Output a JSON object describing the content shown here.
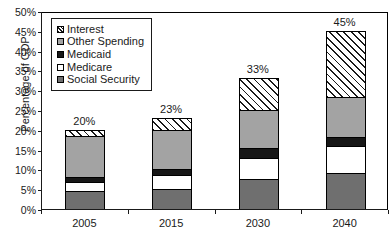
{
  "chart_data": {
    "type": "bar",
    "subtype": "stacked-column",
    "title": "",
    "xlabel": "",
    "ylabel": "Percentage of GDP",
    "categories": [
      "2005",
      "2015",
      "2030",
      "2040"
    ],
    "ylim": [
      0,
      50
    ],
    "ytick_labels": [
      "0%",
      "5%",
      "10%",
      "15%",
      "20%",
      "25%",
      "30%",
      "35%",
      "40%",
      "45%",
      "50%"
    ],
    "ytick_values": [
      0,
      5,
      10,
      15,
      20,
      25,
      30,
      35,
      40,
      45,
      50
    ],
    "yaxis_unit": "%",
    "grid": false,
    "legend_position": "upper-left-inside",
    "series": [
      {
        "name": "Social Security",
        "pattern": "solid-dark-gray",
        "color": "#6f6f6f",
        "values": [
          4.5,
          5.0,
          7.5,
          9.0
        ]
      },
      {
        "name": "Medicare",
        "pattern": "solid-white",
        "color": "#ffffff",
        "values": [
          2.3,
          3.6,
          5.5,
          7.0
        ]
      },
      {
        "name": "Medicaid",
        "pattern": "solid-black",
        "color": "#171717",
        "values": [
          1.4,
          1.4,
          2.3,
          2.3
        ]
      },
      {
        "name": "Other Spending",
        "pattern": "solid-light-gray",
        "color": "#a3a3a3",
        "values": [
          10.3,
          10.0,
          9.7,
          10.0
        ]
      },
      {
        "name": "Interest",
        "pattern": "diagonal-hatch",
        "color": "#ffffff",
        "values": [
          1.5,
          3.0,
          8.0,
          16.7
        ]
      }
    ],
    "stack_order_bottom_to_top": [
      "Social Security",
      "Medicare",
      "Medicaid",
      "Other Spending",
      "Interest"
    ],
    "totals": [
      20,
      23,
      33,
      45
    ],
    "data_labels": [
      "20%",
      "23%",
      "33%",
      "45%"
    ]
  },
  "legend": {
    "items": [
      {
        "label": "Interest",
        "swatch": "sw-interest"
      },
      {
        "label": "Other Spending",
        "swatch": "sw-other"
      },
      {
        "label": "Medicaid",
        "swatch": "sw-medicaid"
      },
      {
        "label": "Medicare",
        "swatch": "sw-medicare"
      },
      {
        "label": "Social Security",
        "swatch": "sw-social"
      }
    ]
  }
}
